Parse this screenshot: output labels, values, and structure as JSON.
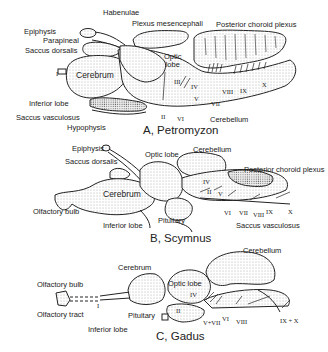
{
  "figure": {
    "panels": [
      {
        "id": "A",
        "caption": "A, Petromyzon",
        "labels": {
          "habenulae": "Habenulae",
          "plexus_mesencephali": "Plexus mesencephali",
          "posterior_choroid_plexus": "Posterior choroid plexus",
          "epiphysis": "Epiphysis",
          "parapineal": "Parapineal",
          "saccus_dorsalis": "Saccus dorsalis",
          "optic_lobe": "Optic\nlobe",
          "cerebrum": "Cerebrum",
          "inferior_lobe": "Inferior lobe",
          "saccus_vasculosus": "Saccus vasculosus",
          "hypophysis": "Hypophysis",
          "cerebellum": "Cerebellum"
        },
        "nerves": [
          "I",
          "II",
          "III",
          "IV",
          "V",
          "VI",
          "VII",
          "VIII",
          "IX",
          "X"
        ]
      },
      {
        "id": "B",
        "caption": "B, Scymnus",
        "labels": {
          "epiphysis": "Epiphysis",
          "saccus_dorsalis": "Saccus dorsalis",
          "optic_lobe": "Optic lobe",
          "cerebellum": "Cerebellum",
          "posterior_choroid_plexus": "Posterior choroid plexus",
          "cerebrum": "Cerebrum",
          "olfactory_bulb": "Olfactory bulb",
          "inferior_lobe": "Inferior lobe",
          "pituitary": "Pituitary",
          "saccus_vasculosus": "Saccus vasculosus"
        },
        "nerves": [
          "II",
          "IV",
          "V",
          "VI",
          "VII",
          "VIII",
          "IX",
          "X"
        ]
      },
      {
        "id": "C",
        "caption": "C, Gadus",
        "labels": {
          "cerebellum": "Cerebellum",
          "cerebrum": "Cerebrum",
          "optic_lobe": "Optic lobe",
          "olfactory_bulb": "Olfactory bulb",
          "olfactory_tract": "Olfactory tract",
          "pituitary": "Pituitary",
          "inferior_lobe": "Inferior lobe"
        },
        "nerves": [
          "I",
          "II",
          "IV",
          "V+VII",
          "VI",
          "VIII",
          "IX + X"
        ]
      }
    ]
  }
}
